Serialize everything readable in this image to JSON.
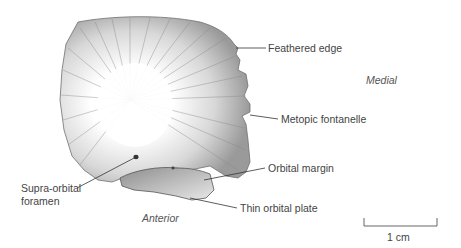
{
  "figure": {
    "labels": {
      "feathered_edge": "Feathered edge",
      "metopic_fontanelle": "Metopic fontanelle",
      "orbital_margin": "Orbital margin",
      "thin_orbital_plate": "Thin orbital plate",
      "supra_orbital_foramen_line1": "Supra-orbital",
      "supra_orbital_foramen_line2": "foramen"
    },
    "orientation": {
      "medial": "Medial",
      "anterior": "Anterior"
    },
    "scale_bar": {
      "label": "1 cm"
    },
    "colors": {
      "bone_shading": "#8a8a8a",
      "outline": "#6a6a6a",
      "text": "#444444",
      "leader": "#333333"
    }
  }
}
